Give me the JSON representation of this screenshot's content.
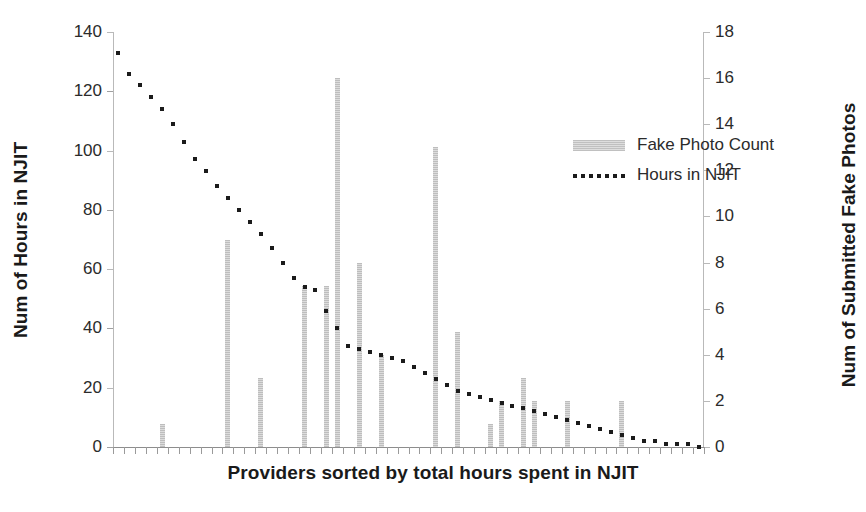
{
  "chart_data": {
    "type": "bar",
    "title": "",
    "subtitle": "",
    "xlabel": "Providers sorted by total hours spent in NJIT",
    "ylabel": "Num of Hours in NJIT",
    "ylabel_secondary": "Num of Submitted Fake Photos",
    "grid": false,
    "legend_position": "inside-upper-center",
    "ylim": [
      0,
      140
    ],
    "yticks": [
      0,
      20,
      40,
      60,
      80,
      100,
      120,
      140
    ],
    "ylim_secondary": [
      0,
      18
    ],
    "yticks_secondary": [
      0,
      2,
      4,
      6,
      8,
      10,
      12,
      14,
      16,
      18
    ],
    "xtick_labels": [],
    "x_count": 54,
    "series": [
      {
        "name": "Fake Photo Count",
        "type": "bar",
        "axis": "secondary",
        "color": "#c7c7c7",
        "values": [
          0,
          0,
          0,
          0,
          1,
          0,
          0,
          0,
          0,
          0,
          9,
          0,
          0,
          3,
          0,
          0,
          0,
          7,
          0,
          7,
          16,
          0,
          8,
          0,
          4,
          0,
          0,
          0,
          0,
          13,
          0,
          5,
          0,
          0,
          1,
          2,
          0,
          3,
          2,
          0,
          0,
          2,
          0,
          0,
          0,
          0,
          2,
          0,
          0,
          0,
          0,
          0,
          0,
          0
        ]
      },
      {
        "name": "Hours in NJIT",
        "type": "line",
        "style": "dotted",
        "axis": "primary",
        "color": "#1b1b1b",
        "values": [
          133,
          126,
          122,
          118,
          114,
          109,
          103,
          97,
          93,
          88,
          84,
          80,
          76,
          72,
          67,
          62,
          57,
          54,
          53,
          46,
          40,
          34,
          33,
          32,
          31,
          30,
          29,
          27,
          25,
          23,
          21,
          19,
          18,
          17,
          16,
          15,
          14,
          13,
          12,
          11,
          10,
          9,
          8,
          7,
          6,
          5,
          4,
          3,
          2,
          2,
          1,
          1,
          1,
          0
        ]
      }
    ],
    "legend": [
      {
        "label": "Fake Photo Count",
        "marker": "bar-swatch"
      },
      {
        "label": "Hours in NJIT",
        "marker": "dotted-line"
      }
    ]
  },
  "colors": {
    "bar": "#c7c7c7",
    "line": "#1b1b1b",
    "axis": "#b9b9b9",
    "text": "#2b2b2b",
    "background": "#ffffff"
  }
}
